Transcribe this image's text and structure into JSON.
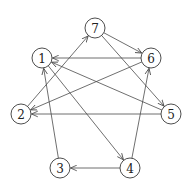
{
  "diagram": {
    "type": "directed-graph",
    "nodes": [
      {
        "id": "1",
        "label": "1",
        "x": 42,
        "y": 58
      },
      {
        "id": "2",
        "label": "2",
        "x": 21,
        "y": 114
      },
      {
        "id": "3",
        "label": "3",
        "x": 60,
        "y": 168
      },
      {
        "id": "4",
        "label": "4",
        "x": 130,
        "y": 168
      },
      {
        "id": "5",
        "label": "5",
        "x": 171,
        "y": 114
      },
      {
        "id": "6",
        "label": "6",
        "x": 151,
        "y": 58
      },
      {
        "id": "7",
        "label": "7",
        "x": 95,
        "y": 28
      }
    ],
    "edges": [
      {
        "from": "7",
        "to": "6"
      },
      {
        "from": "6",
        "to": "1"
      },
      {
        "from": "2",
        "to": "7"
      },
      {
        "from": "7",
        "to": "5"
      },
      {
        "from": "1",
        "to": "4"
      },
      {
        "from": "5",
        "to": "1"
      },
      {
        "from": "6",
        "to": "2"
      },
      {
        "from": "5",
        "to": "2"
      },
      {
        "from": "3",
        "to": "1"
      },
      {
        "from": "4",
        "to": "6"
      },
      {
        "from": "4",
        "to": "3"
      }
    ],
    "node_radius": 10,
    "colors": {
      "stroke": "#3a3a3a",
      "edge": "#4a4a4a",
      "background": "#ffffff"
    }
  }
}
